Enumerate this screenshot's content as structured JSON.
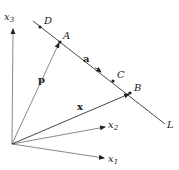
{
  "diagram": {
    "type": "vector-line-diagram",
    "origin": {
      "x": 12,
      "y": 144
    },
    "axes": [
      {
        "name": "x3",
        "label": "x",
        "subscript": "3",
        "tip": {
          "x": 13,
          "y": 29
        },
        "label_pos": {
          "x": 4,
          "y": 20
        }
      },
      {
        "name": "x2",
        "label": "x",
        "subscript": "2",
        "tip": {
          "x": 105,
          "y": 127
        },
        "label_pos": {
          "x": 108,
          "y": 128
        }
      },
      {
        "name": "x1",
        "label": "x",
        "subscript": "1",
        "tip": {
          "x": 104,
          "y": 158
        },
        "label_pos": {
          "x": 108,
          "y": 162
        }
      }
    ],
    "line_L": {
      "start": {
        "x": 33,
        "y": 21
      },
      "end": {
        "x": 165,
        "y": 124
      },
      "label": "L",
      "label_pos": {
        "x": 167,
        "y": 128
      }
    },
    "points": [
      {
        "name": "D",
        "label": "D",
        "pos": {
          "x": 40,
          "y": 27
        },
        "label_pos": {
          "x": 44,
          "y": 24
        }
      },
      {
        "name": "A",
        "label": "A",
        "pos": {
          "x": 60,
          "y": 42
        },
        "label_pos": {
          "x": 63,
          "y": 39
        }
      },
      {
        "name": "C",
        "label": "C",
        "pos": {
          "x": 113,
          "y": 81
        },
        "label_pos": {
          "x": 117,
          "y": 78
        }
      },
      {
        "name": "B",
        "label": "B",
        "pos": {
          "x": 130,
          "y": 93
        },
        "label_pos": {
          "x": 134,
          "y": 91
        }
      }
    ],
    "vectors": [
      {
        "name": "p",
        "label": "p",
        "from": {
          "x": 12,
          "y": 144
        },
        "to": {
          "x": 59,
          "y": 43
        },
        "label_pos": {
          "x": 38,
          "y": 83
        }
      },
      {
        "name": "x",
        "label": "x",
        "from": {
          "x": 12,
          "y": 144
        },
        "to": {
          "x": 129,
          "y": 94
        },
        "label_pos": {
          "x": 77,
          "y": 110
        }
      },
      {
        "name": "a",
        "label": "a",
        "from": {
          "x": 60,
          "y": 42
        },
        "to": {
          "x": 101,
          "y": 72
        },
        "label_pos": {
          "x": 83,
          "y": 62
        }
      }
    ]
  }
}
